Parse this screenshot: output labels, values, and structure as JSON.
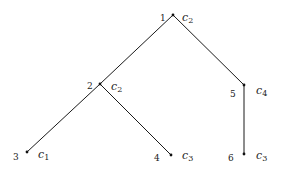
{
  "diagram": {
    "type": "tree",
    "nodes": [
      {
        "id": "1",
        "index_label": "1",
        "class_label": "c",
        "class_sub": "2",
        "x": 173,
        "y": 15,
        "ix": 160,
        "iy": 21,
        "lx": 182,
        "ly": 21
      },
      {
        "id": "2",
        "index_label": "2",
        "class_label": "c",
        "class_sub": "2",
        "x": 100,
        "y": 84,
        "ix": 87,
        "iy": 89,
        "lx": 111,
        "ly": 90
      },
      {
        "id": "3",
        "index_label": "3",
        "class_label": "c",
        "class_sub": "1",
        "x": 27,
        "y": 152,
        "ix": 13,
        "iy": 160,
        "lx": 38,
        "ly": 158
      },
      {
        "id": "4",
        "index_label": "4",
        "class_label": "c",
        "class_sub": "3",
        "x": 171,
        "y": 155,
        "ix": 154,
        "iy": 161,
        "lx": 182,
        "ly": 159
      },
      {
        "id": "5",
        "index_label": "5",
        "class_label": "c",
        "class_sub": "4",
        "x": 244,
        "y": 85,
        "ix": 230,
        "iy": 97,
        "lx": 256,
        "ly": 94
      },
      {
        "id": "6",
        "index_label": "6",
        "class_label": "c",
        "class_sub": "3",
        "x": 244,
        "y": 154,
        "ix": 228,
        "iy": 161,
        "lx": 256,
        "ly": 159
      }
    ],
    "edges": [
      {
        "from": "1",
        "to": "2"
      },
      {
        "from": "1",
        "to": "5"
      },
      {
        "from": "2",
        "to": "3"
      },
      {
        "from": "2",
        "to": "4"
      },
      {
        "from": "5",
        "to": "6"
      }
    ]
  }
}
